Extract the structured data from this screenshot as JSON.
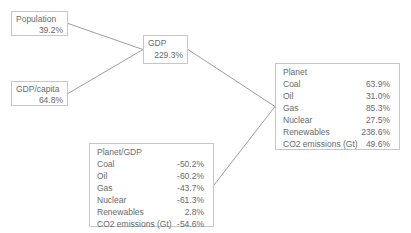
{
  "diagram": {
    "colors": {
      "background": "#ffffff",
      "box_border": "#c7c7c7",
      "text": "#6a6a6a",
      "edge_line": "#9e9e9e"
    },
    "nodes": {
      "population": {
        "label": "Population",
        "value": "39.2%"
      },
      "gdp_capita": {
        "label": "GDP/capita",
        "value": "64.8%"
      },
      "gdp": {
        "label": "GDP",
        "value": "229.3%"
      },
      "planet": {
        "label": "Planet",
        "rows": [
          {
            "label": "Coal",
            "value": "63.9%"
          },
          {
            "label": "Oil",
            "value": "31.0%"
          },
          {
            "label": "Gas",
            "value": "85.3%"
          },
          {
            "label": "Nuclear",
            "value": "27.5%"
          },
          {
            "label": "Renewables",
            "value": "238.6%"
          },
          {
            "label": "CO2 emissions (Gt)",
            "value": "49.6%"
          }
        ]
      },
      "planet_gdp": {
        "label": "Planet/GDP",
        "rows": [
          {
            "label": "Coal",
            "value": "-50.2%"
          },
          {
            "label": "Oil",
            "value": "-60.2%"
          },
          {
            "label": "Gas",
            "value": "-43.7%"
          },
          {
            "label": "Nuclear",
            "value": "-61.3%"
          },
          {
            "label": "Renewables",
            "value": "2.8%"
          },
          {
            "label": "CO2 emissions (Gt)",
            "value": "-54.6%"
          }
        ]
      }
    },
    "edges": [
      {
        "from": "population",
        "to": "gdp"
      },
      {
        "from": "gdp_capita",
        "to": "gdp"
      },
      {
        "from": "gdp",
        "to": "planet"
      },
      {
        "from": "planet_gdp",
        "to": "planet"
      }
    ]
  }
}
